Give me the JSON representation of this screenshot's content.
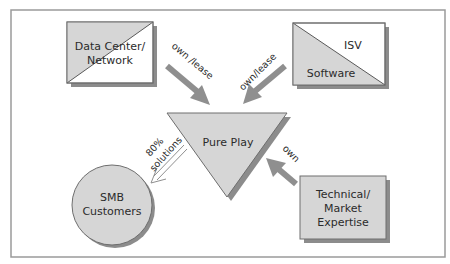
{
  "diagram": {
    "colors": {
      "frame": "#9a9a9a",
      "shape_fill": "#d6d6d6",
      "shape_stroke": "#6e6e6e",
      "shadow": "#8c8c8c",
      "arrow": "#8f8f8f",
      "text": "#2b2b2b"
    },
    "nodes": {
      "data_center": {
        "line1": "Data Center/",
        "line2": "Network"
      },
      "isv": {
        "top_label": "ISV",
        "bottom_label": "Software"
      },
      "pure_play": {
        "label": "Pure Play"
      },
      "smb": {
        "line1": "SMB",
        "line2": "Customers"
      },
      "expertise": {
        "line1": "Technical/",
        "line2": "Market",
        "line3": "Expertise"
      }
    },
    "edges": {
      "data_center_to_pure_play": {
        "label": "own /lease"
      },
      "isv_to_pure_play": {
        "label": "own/lease"
      },
      "expertise_to_pure_play": {
        "label": "own"
      },
      "pure_play_to_smb": {
        "line1": "80%",
        "line2": "solutions"
      }
    }
  }
}
